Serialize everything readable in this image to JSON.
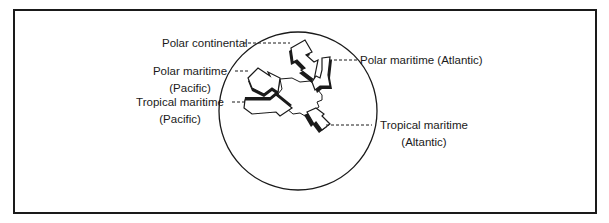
{
  "diagram": {
    "type": "air-mass-source-regions",
    "colors": {
      "ink": "#1a1a1a",
      "background": "#ffffff"
    },
    "labels": {
      "polar_continental": "Polar continental",
      "polar_maritime_pacific_line1": "Polar maritime",
      "polar_maritime_pacific_line2": "(Pacific)",
      "tropical_maritime_pacific_line1": "Tropical maritime",
      "tropical_maritime_pacific_line2": "(Pacific)",
      "polar_maritime_atlantic": "Polar maritime (Atlantic)",
      "tropical_maritime_atlantic_line1": "Tropical maritime",
      "tropical_maritime_atlantic_line2": "(Altantic)"
    },
    "air_masses": [
      {
        "name": "Polar continental",
        "direction": "from north"
      },
      {
        "name": "Polar maritime (Pacific)",
        "direction": "from northwest"
      },
      {
        "name": "Tropical maritime (Pacific)",
        "direction": "from west/southwest"
      },
      {
        "name": "Polar maritime (Atlantic)",
        "direction": "from northeast"
      },
      {
        "name": "Tropical maritime (Atlantic)",
        "direction": "from south/southeast"
      }
    ]
  }
}
